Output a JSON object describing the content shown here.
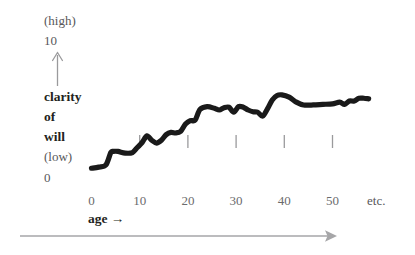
{
  "figure": {
    "y_axis": {
      "high_label": "(high)",
      "high_value": "10",
      "low_label": "(low)",
      "low_value": "0",
      "title_line1": "clarity",
      "title_line2": "of",
      "title_line3": "will",
      "arrow_icon": "up-arrow-icon"
    },
    "x_axis": {
      "label": "age →",
      "trailing_label": "etc.",
      "arrow_icon": "right-arrow-icon"
    },
    "colors": {
      "curve": "#1a1a1a",
      "axis_gray": "#9a9a9c",
      "text_gray": "#58585a",
      "text_dark": "#231f20",
      "background": "#ffffff"
    }
  },
  "chart_data": {
    "type": "line",
    "title": "",
    "xlabel": "age →",
    "ylabel": "clarity of will",
    "xlim": [
      0,
      58
    ],
    "ylim": [
      0,
      10
    ],
    "grid": false,
    "legend": null,
    "x_ticks": [
      0,
      10,
      20,
      30,
      40,
      50
    ],
    "x_tick_labels": [
      "0",
      "10",
      "20",
      "30",
      "40",
      "50"
    ],
    "y_ticks": [
      0,
      10
    ],
    "y_tick_labels": [
      "0",
      "10"
    ],
    "y_tick_annotations": [
      "(low)",
      "(high)"
    ],
    "interior_tick_marks_at_x": [
      10,
      20,
      30,
      40,
      50
    ],
    "annotations": [
      "etc."
    ],
    "series": [
      {
        "name": "clarity of will",
        "x": [
          0.0,
          1.5,
          3.0,
          4.0,
          4.5,
          5.5,
          7.0,
          8.5,
          9.5,
          10.5,
          11.5,
          12.5,
          13.5,
          14.5,
          15.5,
          16.5,
          17.5,
          18.5,
          19.5,
          20.5,
          21.5,
          22.5,
          24.0,
          25.5,
          26.5,
          27.5,
          28.5,
          29.5,
          30.5,
          31.5,
          32.5,
          33.5,
          34.5,
          35.5,
          36.5,
          37.5,
          38.5,
          39.5,
          41.0,
          42.5,
          44.0,
          46.0,
          48.0,
          50.0,
          51.5,
          52.5,
          53.5,
          54.5,
          55.5,
          56.5,
          57.5
        ],
        "y": [
          1.05,
          1.15,
          1.35,
          2.45,
          2.55,
          2.55,
          2.4,
          2.45,
          2.9,
          3.35,
          3.95,
          3.55,
          3.3,
          3.55,
          4.05,
          4.25,
          4.2,
          4.35,
          5.0,
          5.3,
          5.35,
          6.3,
          6.55,
          6.4,
          6.25,
          6.45,
          6.5,
          6.05,
          6.55,
          6.5,
          6.25,
          6.1,
          6.05,
          5.7,
          6.35,
          7.15,
          7.55,
          7.6,
          7.4,
          6.95,
          6.7,
          6.7,
          6.75,
          6.8,
          6.95,
          6.75,
          7.05,
          7.05,
          7.3,
          7.3,
          7.25
        ]
      }
    ]
  }
}
